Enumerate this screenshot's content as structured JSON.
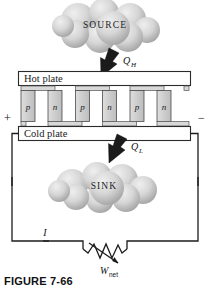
{
  "figure": {
    "caption": "FIGURE 7-66",
    "title_text": "SOURCE",
    "sink_text": "SINK",
    "hot_plate_label": "Hot plate",
    "cold_plate_label": "Cold plate",
    "heat_in_symbol": "Q",
    "heat_in_subscript": "H",
    "heat_out_symbol": "Q",
    "heat_out_subscript": "L",
    "work_symbol": "W",
    "work_subscript": "net",
    "current_label": "I",
    "terminal_positive": "+",
    "terminal_negative": "−"
  },
  "semiconductor_elements": [
    {
      "type": "p",
      "label": "p"
    },
    {
      "type": "n",
      "label": "n"
    },
    {
      "type": "p",
      "label": "p"
    },
    {
      "type": "n",
      "label": "n"
    },
    {
      "type": "p",
      "label": "p"
    },
    {
      "type": "n",
      "label": "n"
    }
  ],
  "colors": {
    "cloud_fill_light": "#e4e4e4",
    "cloud_fill_dark": "#9c9c9c",
    "element_fill": "#cfcfcf",
    "plate_fill": "#ffffff",
    "wire": "#1c1c1c",
    "arrow": "#1b1b1b",
    "text": "#111111"
  }
}
